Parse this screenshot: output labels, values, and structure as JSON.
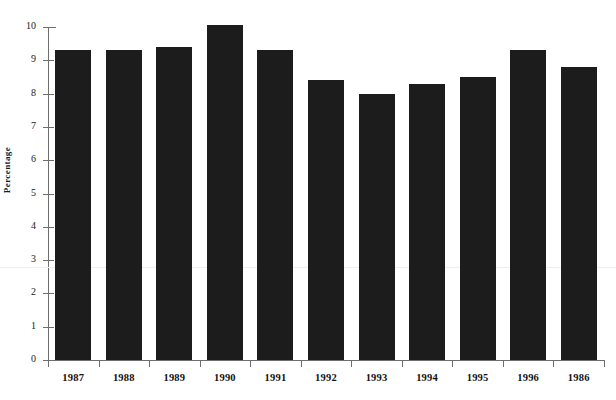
{
  "chart_data": {
    "type": "bar",
    "title": "",
    "xlabel": "",
    "ylabel": "Percentage",
    "categories": [
      "1987",
      "1988",
      "1989",
      "1990",
      "1991",
      "1992",
      "1993",
      "1994",
      "1995",
      "1996",
      "1986"
    ],
    "values": [
      9.3,
      9.3,
      9.4,
      10.05,
      9.3,
      8.4,
      8.0,
      8.3,
      8.5,
      9.3,
      8.8
    ],
    "ylim": [
      0,
      10
    ],
    "yticks": [
      0,
      1,
      2,
      3,
      4,
      5,
      6,
      7,
      8,
      9,
      10
    ],
    "ytick_labels": [
      "0",
      "1",
      "2",
      "3",
      "4",
      "5",
      "6",
      "7",
      "8",
      "9",
      "10"
    ],
    "grid": false,
    "legend": null,
    "bar_color": "#1c1c1c",
    "axis_color": "#6e6e6e",
    "background": "#ffffff"
  }
}
